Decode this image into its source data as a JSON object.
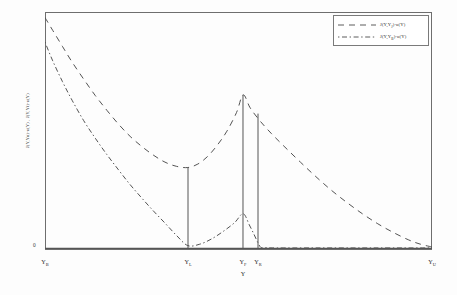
{
  "figure": {
    "background_color": "#fdfdfd",
    "frame_color": "#6e6e6e",
    "curve_color": "#4a4a4a",
    "vline_color": "#555555"
  },
  "axes": {
    "ylabel": "J(Y,Yʙ)-u(Y) ,  J(Y,Yʇ)-u(Y)",
    "ylabel_plain": "J(Y,YB)-u(Y) , J(Y,YJ)-u(Y)",
    "xlabel": "Y",
    "zero_tick": "0",
    "xticks": [
      {
        "label": "Y",
        "sub": "B",
        "x_frac": 0.0
      },
      {
        "label": "Y",
        "sub": "L",
        "x_frac": 0.3695
      },
      {
        "label": "Y",
        "sub": "F",
        "x_frac": 0.5116
      },
      {
        "label": "Y",
        "sub": "R",
        "x_frac": 0.5504
      },
      {
        "label": "Y",
        "sub": "U",
        "x_frac": 1.0
      }
    ]
  },
  "legend": {
    "position": "top-right",
    "entries": [
      {
        "label": "J(Y,Y",
        "sub": "J",
        "tail": ")-u(Y)",
        "dash": "long-dash"
      },
      {
        "label": "J(Y,Y",
        "sub": "B",
        "tail": ")-u(Y)",
        "dash": "dash-dot"
      }
    ]
  },
  "chart_data": {
    "type": "line",
    "title": "",
    "xlabel": "Y",
    "ylabel": "J(Y,YB)-u(Y) , J(Y,YJ)-u(Y)",
    "xlim": [
      0,
      1
    ],
    "ylim": [
      0,
      1
    ],
    "grid": false,
    "legend_position": "top-right",
    "xtick_labels": [
      "YB",
      "YL",
      "YF",
      "YR",
      "YU"
    ],
    "xtick_positions": [
      0.0,
      0.3695,
      0.5116,
      0.5504,
      1.0
    ],
    "ytick_labels": [
      "0"
    ],
    "ytick_positions": [
      0.0
    ],
    "annotations": [
      {
        "name": "vline-YL",
        "x": 0.3695,
        "y_top": 0.345,
        "y_bottom": 0.0
      },
      {
        "name": "vline-YF",
        "x": 0.5116,
        "y_top": 0.655,
        "y_bottom": 0.0
      },
      {
        "name": "vline-YR",
        "x": 0.5504,
        "y_top": 0.575,
        "y_bottom": 0.0
      }
    ],
    "series": [
      {
        "name": "J(Y,YJ)-u(Y)",
        "dash": "long-dash",
        "x": [
          0.0,
          0.02,
          0.045,
          0.07,
          0.1,
          0.13,
          0.16,
          0.19,
          0.22,
          0.25,
          0.28,
          0.31,
          0.34,
          0.369,
          0.395,
          0.42,
          0.445,
          0.47,
          0.495,
          0.512,
          0.53,
          0.555,
          0.585,
          0.62,
          0.66,
          0.7,
          0.74,
          0.78,
          0.82,
          0.86,
          0.9,
          0.94,
          0.97,
          1.0
        ],
        "y": [
          0.985,
          0.93,
          0.862,
          0.795,
          0.722,
          0.652,
          0.589,
          0.53,
          0.478,
          0.435,
          0.398,
          0.368,
          0.35,
          0.345,
          0.36,
          0.392,
          0.44,
          0.5,
          0.58,
          0.655,
          0.6,
          0.545,
          0.49,
          0.432,
          0.368,
          0.306,
          0.248,
          0.196,
          0.148,
          0.105,
          0.068,
          0.036,
          0.018,
          0.006
        ]
      },
      {
        "name": "J(Y,YB)-u(Y)",
        "dash": "dash-dot",
        "x": [
          0.0,
          0.02,
          0.045,
          0.07,
          0.1,
          0.13,
          0.16,
          0.19,
          0.22,
          0.25,
          0.28,
          0.31,
          0.34,
          0.369,
          0.4,
          0.43,
          0.46,
          0.49,
          0.512,
          0.528,
          0.54,
          0.55,
          0.558,
          0.57,
          0.6,
          0.7,
          0.85,
          1.0
        ],
        "y": [
          0.88,
          0.8,
          0.712,
          0.632,
          0.545,
          0.47,
          0.4,
          0.335,
          0.272,
          0.215,
          0.16,
          0.108,
          0.055,
          0.012,
          0.018,
          0.04,
          0.072,
          0.11,
          0.148,
          0.1,
          0.06,
          0.025,
          0.004,
          0.003,
          0.002,
          0.002,
          0.002,
          0.002
        ]
      }
    ]
  }
}
